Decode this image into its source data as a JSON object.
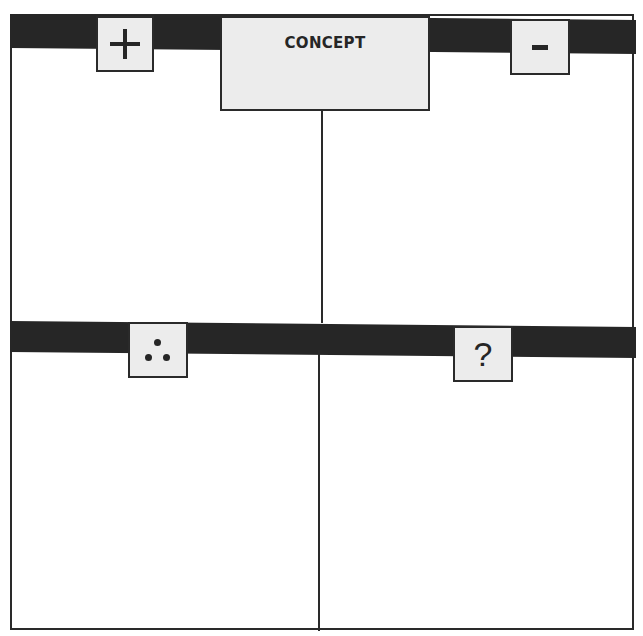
{
  "diagram": {
    "title": "CONCEPT",
    "quadrants": [
      {
        "position": "top-left",
        "symbol": "+",
        "meaning": "plus"
      },
      {
        "position": "top-right",
        "symbol": "-",
        "meaning": "minus"
      },
      {
        "position": "bottom-left",
        "symbol": "∴",
        "meaning": "therefore"
      },
      {
        "position": "bottom-right",
        "symbol": "?",
        "meaning": "question"
      }
    ]
  },
  "colors": {
    "bar": "#262626",
    "box_fill": "#ececec",
    "border": "#2a2a2a",
    "background": "#ffffff"
  }
}
